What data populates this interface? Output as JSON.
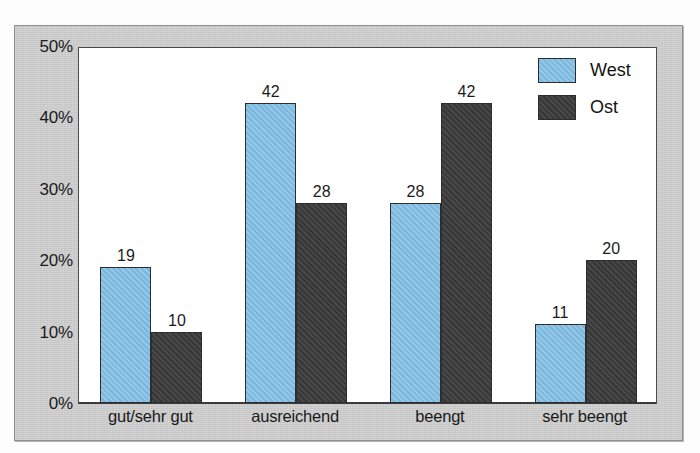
{
  "chart_data": {
    "type": "bar",
    "title": "",
    "subtitle": "",
    "xlabel": "",
    "ylabel": "",
    "categories": [
      "gut/sehr gut",
      "ausreichend",
      "beengt",
      "sehr beengt"
    ],
    "series": [
      {
        "name": "West",
        "color": "#7fbce3",
        "values": [
          19,
          42,
          28,
          11
        ]
      },
      {
        "name": "Ost",
        "color": "#3a3a3a",
        "values": [
          10,
          28,
          42,
          20
        ]
      }
    ],
    "ylim": [
      0,
      50
    ],
    "ytick_step": 10,
    "ytick_labels": [
      "0%",
      "10%",
      "20%",
      "30%",
      "40%",
      "50%"
    ],
    "ytick_values": [
      0,
      10,
      20,
      30,
      40,
      50
    ],
    "grid": false,
    "value_labels": true,
    "legend_position": "top-right",
    "legend_entries": [
      "West",
      "Ost"
    ],
    "frame_color": "#c9c9c9",
    "plot_background": "#ffffff",
    "axis_color": "#4a4a4a"
  }
}
